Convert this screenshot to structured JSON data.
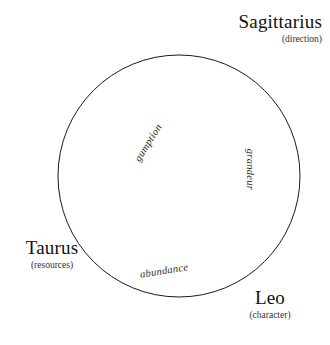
{
  "diagram": {
    "type": "zodiac-circle",
    "background_color": "#ffffff",
    "stroke_color": "#1a1a1a",
    "circle": {
      "center_x": 179,
      "center_y": 176,
      "radius": 121,
      "stroke_width": 1
    },
    "signs": [
      {
        "id": "sagittarius",
        "name": "Sagittarius",
        "keyword": "(direction)",
        "position": "top-right"
      },
      {
        "id": "taurus",
        "name": "Taurus",
        "keyword": "(resources)",
        "position": "left"
      },
      {
        "id": "leo",
        "name": "Leo",
        "keyword": "(character)",
        "position": "bottom-right"
      }
    ],
    "inner_words": [
      {
        "id": "gumption",
        "text": "gumption",
        "rotation_deg": -58
      },
      {
        "id": "grandeur",
        "text": "grandeur",
        "rotation_deg": 90
      },
      {
        "id": "abundance",
        "text": "abundance",
        "rotation_deg": -9
      }
    ]
  }
}
